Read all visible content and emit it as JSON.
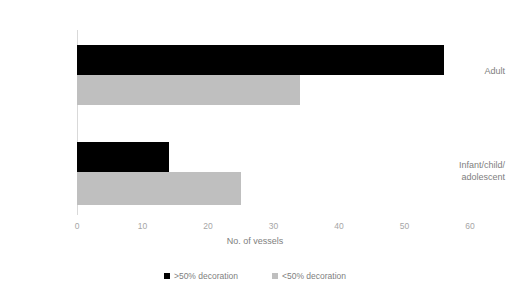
{
  "chart_data": {
    "type": "bar",
    "orientation": "horizontal",
    "title": "",
    "xlabel": "No. of vessels",
    "ylabel": "",
    "xlim": [
      0,
      60
    ],
    "xticks": [
      0,
      10,
      20,
      30,
      40,
      50,
      60
    ],
    "grid": false,
    "legend_position": "bottom",
    "categories": [
      "Adult",
      "Infant/child/\nadolescent"
    ],
    "category_lines": [
      [
        "Adult"
      ],
      [
        "Infant/child/",
        "adolescent"
      ]
    ],
    "series": [
      {
        "name": ">50% decoration",
        "color": "#000000",
        "values": [
          56,
          14
        ]
      },
      {
        "name": "<50% decoration",
        "color": "#bfbfbf",
        "values": [
          34,
          25
        ]
      }
    ]
  },
  "colors": {
    "background": "#ffffff",
    "text": "#808080",
    "tick_text": "#a6a6a6",
    "axis_line": "#d9d9d9",
    "series_high": "#000000",
    "series_low": "#bfbfbf"
  }
}
